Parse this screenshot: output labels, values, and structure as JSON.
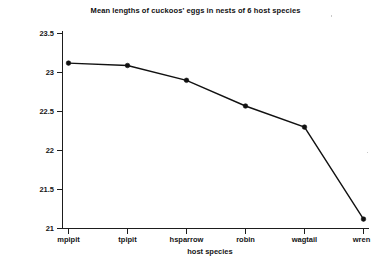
{
  "chart_data": {
    "type": "line",
    "title": "Mean lengths of cuckoos' eggs in nests of 6 host species",
    "xlabel": "host species",
    "ylabel": "mean length of egg (mm)",
    "categories": [
      "mpipit",
      "tpipit",
      "hsparrow",
      "robin",
      "wagtail",
      "wren"
    ],
    "values": [
      23.12,
      23.09,
      22.9,
      22.57,
      22.3,
      21.12
    ],
    "yticks": [
      "23.5",
      "23",
      "22.5",
      "22",
      "21.5",
      "21"
    ],
    "ytick_values": [
      23.5,
      23.0,
      22.5,
      22.0,
      21.5,
      21.0
    ],
    "ylim": [
      21.0,
      23.5
    ],
    "grid": false,
    "legend": false,
    "marker": "filled-circle",
    "line_color": "#111111",
    "marker_color": "#111111",
    "background_color": "#ffffff"
  }
}
